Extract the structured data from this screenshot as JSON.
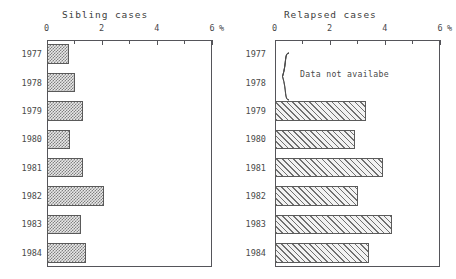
{
  "chart_data": [
    {
      "type": "bar",
      "orientation": "horizontal",
      "title": "Sibling cases",
      "xlabel": "%",
      "ylabel": "",
      "categories": [
        "1977",
        "1978",
        "1979",
        "1980",
        "1981",
        "1982",
        "1983",
        "1984"
      ],
      "values": [
        0.8,
        1.0,
        1.3,
        0.85,
        1.3,
        2.05,
        1.25,
        1.4
      ],
      "xlim": [
        0,
        6
      ],
      "xticks": [
        0,
        1,
        2,
        3,
        4,
        5,
        6
      ],
      "xtick_labels": [
        "0",
        "",
        "2",
        "",
        "4",
        "",
        "6"
      ],
      "grid": false,
      "legend": "none",
      "fill": "checker"
    },
    {
      "type": "bar",
      "orientation": "horizontal",
      "title": "Relapsed cases",
      "xlabel": "%",
      "ylabel": "",
      "categories": [
        "1977",
        "1978",
        "1979",
        "1980",
        "1981",
        "1982",
        "1983",
        "1984"
      ],
      "values": [
        null,
        null,
        3.3,
        2.9,
        3.9,
        3.0,
        4.25,
        3.4
      ],
      "xlim": [
        0,
        6
      ],
      "xticks": [
        0,
        1,
        2,
        3,
        4,
        5,
        6
      ],
      "xtick_labels": [
        "0",
        "",
        "2",
        "",
        "4",
        "",
        "6"
      ],
      "grid": false,
      "legend": "none",
      "fill": "hatch",
      "annotation": "Data not availabe",
      "annotation_categories": [
        "1977",
        "1978"
      ]
    }
  ],
  "charts": {
    "sibling": {
      "title": "Sibling cases",
      "unit": "%",
      "ticks": [
        {
          "label": "0",
          "value": 0
        },
        {
          "label": "",
          "value": 1
        },
        {
          "label": "2",
          "value": 2
        },
        {
          "label": "",
          "value": 3
        },
        {
          "label": "4",
          "value": 4
        },
        {
          "label": "",
          "value": 5
        },
        {
          "label": "6",
          "value": 6
        }
      ],
      "rows": [
        {
          "year": "1977",
          "value": 0.8
        },
        {
          "year": "1978",
          "value": 1.0
        },
        {
          "year": "1979",
          "value": 1.3
        },
        {
          "year": "1980",
          "value": 0.85
        },
        {
          "year": "1981",
          "value": 1.3
        },
        {
          "year": "1982",
          "value": 2.05
        },
        {
          "year": "1983",
          "value": 1.25
        },
        {
          "year": "1984",
          "value": 1.4
        }
      ]
    },
    "relapsed": {
      "title": "Relapsed cases",
      "unit": "%",
      "annotation": "Data not availabe",
      "ticks": [
        {
          "label": "0",
          "value": 0
        },
        {
          "label": "",
          "value": 1
        },
        {
          "label": "2",
          "value": 2
        },
        {
          "label": "",
          "value": 3
        },
        {
          "label": "4",
          "value": 4
        },
        {
          "label": "",
          "value": 5
        },
        {
          "label": "6",
          "value": 6
        }
      ],
      "rows": [
        {
          "year": "1977",
          "value": null
        },
        {
          "year": "1978",
          "value": null
        },
        {
          "year": "1979",
          "value": 3.3
        },
        {
          "year": "1980",
          "value": 2.9
        },
        {
          "year": "1981",
          "value": 3.9
        },
        {
          "year": "1982",
          "value": 3.0
        },
        {
          "year": "1983",
          "value": 4.25
        },
        {
          "year": "1984",
          "value": 3.4
        }
      ]
    }
  },
  "colors": {
    "axis": "#55555a",
    "text": "#4a4a4a",
    "bar_stroke": "#5a5a5a",
    "bar_fill_light": "#e9e9e9",
    "hatch": "#707070",
    "background": "#ffffff"
  }
}
